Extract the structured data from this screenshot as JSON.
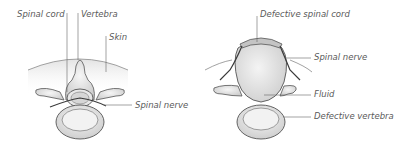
{
  "diagram": {
    "normal": {
      "labels": {
        "spinal_cord": "Spinal cord",
        "vertebra": "Vertebra",
        "skin": "Skin",
        "spinal_nerve": "Spinal nerve"
      }
    },
    "defect": {
      "labels": {
        "defective_spinal_cord": "Defective spinal cord",
        "spinal_nerve": "Spinal nerve",
        "fluid": "Fluid",
        "defective_vertebra": "Defective vertebra"
      }
    },
    "colors": {
      "line": "#555555",
      "fill_light": "#ececec",
      "fill_mid": "#d4d4d4",
      "skin": "#e6e6e6",
      "text": "#5a5a5a"
    }
  }
}
